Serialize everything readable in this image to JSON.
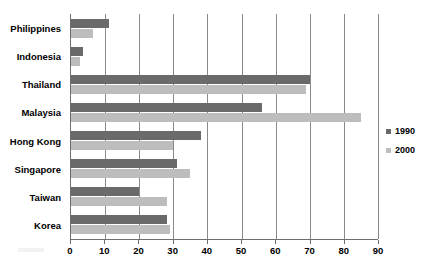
{
  "chart_data": {
    "type": "bar",
    "orientation": "horizontal",
    "title": "",
    "xlabel": "",
    "ylabel": "",
    "xlim": [
      0,
      90
    ],
    "xticks": [
      0,
      10,
      20,
      30,
      40,
      50,
      60,
      70,
      80,
      90
    ],
    "grid": true,
    "legend_position": "right",
    "categories": [
      "Philippines",
      "Indonesia",
      "Thailand",
      "Malaysia",
      "Hong Kong",
      "Singapore",
      "Taiwan",
      "Korea"
    ],
    "series": [
      {
        "name": "1990",
        "color": "#6a6a6a",
        "values": [
          11,
          3.5,
          70,
          56,
          38,
          31,
          20,
          28
        ]
      },
      {
        "name": "2000",
        "color": "#bdbdbd",
        "values": [
          6.5,
          2.5,
          69,
          85,
          30,
          35,
          28,
          29
        ]
      }
    ]
  },
  "legend": {
    "items": [
      {
        "label": "1990",
        "series": "s1990"
      },
      {
        "label": "2000",
        "series": "s2000"
      }
    ]
  },
  "page": {
    "cropped_title": ""
  }
}
